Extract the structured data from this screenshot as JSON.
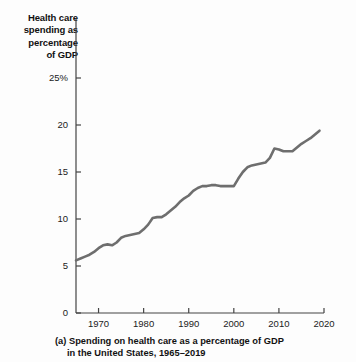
{
  "figure": {
    "axis_title": "Health care\nspending as\npercentage\nof GDP",
    "axis_title_lines": [
      "Health care",
      "spending as",
      "percentage",
      "of GDP"
    ],
    "caption_line1": "(a) Spending on health care as a percentage of GDP",
    "caption_line2": "in the United States, 1965–2019",
    "line_color": "#6e6e6e",
    "axis_color": "#444444",
    "background": "#fdfdfd"
  },
  "chart_data": {
    "type": "line",
    "title": "Health care spending as percentage of GDP",
    "subtitle": "(a) Spending on health care as a percentage of GDP in the United States, 1965–2019",
    "xlabel": "",
    "ylabel": "Health care spending as percentage of GDP",
    "xlim": [
      1965,
      2020
    ],
    "ylim": [
      0,
      25
    ],
    "xticks": [
      1970,
      1980,
      1990,
      2000,
      2010,
      2020
    ],
    "xtick_labels": [
      "1970",
      "1980",
      "1990",
      "2000",
      "2010",
      "2020"
    ],
    "yticks": [
      0,
      5,
      10,
      15,
      20,
      25
    ],
    "ytick_labels": [
      "0",
      "5",
      "10",
      "15",
      "20",
      "25%"
    ],
    "grid": false,
    "legend": false,
    "series": [
      {
        "name": "Health care spending (% of GDP)",
        "color": "#6e6e6e",
        "x": [
          1965,
          1966,
          1967,
          1968,
          1969,
          1970,
          1971,
          1972,
          1973,
          1974,
          1975,
          1976,
          1977,
          1978,
          1979,
          1980,
          1981,
          1982,
          1983,
          1984,
          1985,
          1986,
          1987,
          1988,
          1989,
          1990,
          1991,
          1992,
          1993,
          1994,
          1995,
          1996,
          1997,
          1998,
          1999,
          2000,
          2001,
          2002,
          2003,
          2004,
          2005,
          2006,
          2007,
          2008,
          2009,
          2010,
          2011,
          2012,
          2013,
          2014,
          2015,
          2016,
          2017,
          2018,
          2019
        ],
        "values": [
          5.6,
          5.8,
          6.0,
          6.2,
          6.5,
          6.9,
          7.2,
          7.3,
          7.2,
          7.5,
          8.0,
          8.2,
          8.3,
          8.4,
          8.5,
          8.9,
          9.4,
          10.1,
          10.2,
          10.2,
          10.5,
          10.9,
          11.3,
          11.8,
          12.2,
          12.5,
          13.0,
          13.3,
          13.5,
          13.5,
          13.6,
          13.6,
          13.5,
          13.5,
          13.5,
          13.5,
          14.3,
          15.0,
          15.5,
          15.7,
          15.8,
          15.9,
          16.0,
          16.5,
          17.5,
          17.4,
          17.2,
          17.2,
          17.2,
          17.6,
          18.0,
          18.3,
          18.6,
          19.0,
          19.4
        ]
      }
    ],
    "annotations": []
  }
}
